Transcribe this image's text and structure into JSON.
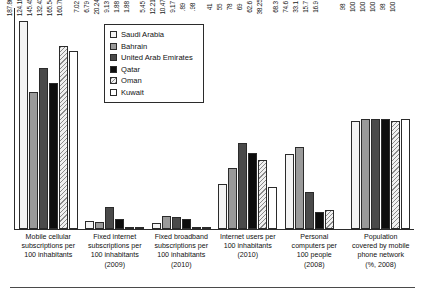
{
  "chart_data": {
    "type": "bar",
    "title": "",
    "xlabel": "",
    "ylabel": "",
    "grid": false,
    "legend_position": "top-center-inside",
    "ylim": [
      0,
      200
    ],
    "categories": [
      "Mobile cellular subscriptions per 100 inhabitants",
      "Fixed internet subscriptions per 100 inhabitants (2009)",
      "Fixed broadband subscriptions per 100 inhabitants (2010)",
      "Internet users per 100 inhabitants (2010)",
      "Personal computers per 100 people (2008)",
      "Population covered by mobile phone network (%, 2008)"
    ],
    "category_lines": [
      [
        "Mobile cellular",
        "subscriptions per",
        "100 inhabitants"
      ],
      [
        "Fixed internet",
        "subscriptions per",
        "100 inhabitants",
        "(2009)"
      ],
      [
        "Fixed broadband",
        "subscriptions per",
        "100 inhabitants",
        "(2010)"
      ],
      [
        "Internet users per",
        "100 inhabitants",
        "(2010)"
      ],
      [
        "Personal",
        "computers per",
        "100 people",
        "(2008)"
      ],
      [
        "Population",
        "covered by mobile",
        "phone network",
        "(%, 2008)"
      ]
    ],
    "series": [
      {
        "name": "Saudi Arabia",
        "swatch": "white",
        "values": [
          187.86,
          7.02,
          5.45,
          41,
          68.3,
          98
        ]
      },
      {
        "name": "Bahrain",
        "swatch": "gray",
        "values": [
          124.18,
          6.79,
          12.21,
          55,
          74.6,
          100
        ]
      },
      {
        "name": "United Arab Emirates",
        "swatch": "dark-gray",
        "values": [
          145.45,
          20.24,
          10.47,
          78,
          33.1,
          100
        ]
      },
      {
        "name": "Qatar",
        "swatch": "black",
        "values": [
          132.43,
          9.13,
          9.17,
          69,
          15.7,
          100
        ]
      },
      {
        "name": "Oman",
        "swatch": "hatched",
        "values": [
          165.54,
          1.88,
          0.89,
          62.6,
          16.9,
          98
        ]
      },
      {
        "name": "Kuwait",
        "swatch": "white-open",
        "values": [
          160.78,
          1.88,
          0.98,
          38.25,
          null,
          100
        ]
      }
    ],
    "value_labels": [
      [
        "187.86",
        "124.18",
        "145.45",
        "132.43",
        "165.54",
        "160.78"
      ],
      [
        "7.02",
        "6.79",
        "20.24",
        "9.13",
        "1.88",
        "1.88"
      ],
      [
        "5.45",
        "12.21",
        "10.47",
        "9.17",
        ".89",
        ".98"
      ],
      [
        "41",
        "55",
        "78",
        "69",
        "62.6",
        "38.25"
      ],
      [
        "68.3",
        "74.6",
        "33.1",
        "15.7",
        "16.9",
        ""
      ],
      [
        "98",
        "100",
        "100",
        "100",
        "98",
        "100"
      ]
    ]
  },
  "legend": {
    "items": [
      {
        "label": "Saudi Arabia"
      },
      {
        "label": "Bahrain"
      },
      {
        "label": "United Arab Emirates"
      },
      {
        "label": "Qatar"
      },
      {
        "label": "Oman"
      },
      {
        "label": "Kuwait"
      }
    ]
  },
  "colors": {
    "axis": "#2b2b2b",
    "series_saudi_arabia": "#f4f4f4",
    "series_bahrain": "#9a9a9a",
    "series_uae": "#4a4a4a",
    "series_qatar": "#0d0d0d",
    "series_oman": "#f0f0f0",
    "series_kuwait": "#ffffff",
    "background": "#ffffff"
  }
}
